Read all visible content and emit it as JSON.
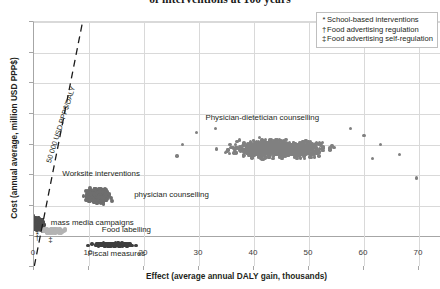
{
  "chart_data": {
    "type": "scatter",
    "title": "of interventions at 100 years",
    "xlabel": "Effect (average annual DALY gain, thousands)",
    "ylabel": "Cost (annual average, million USD PPP$)",
    "xlim": [
      0,
      80
    ],
    "ylim": [
      -100,
      700
    ],
    "xticks": [
      0,
      10,
      20,
      30,
      40,
      50,
      60,
      70,
      80
    ],
    "yticks": [
      -100,
      0,
      100,
      200,
      300,
      400,
      500,
      600,
      700
    ],
    "grid": true,
    "legend_position": "top-right",
    "legend": [
      {
        "marker": "*",
        "label": "School-based interventions"
      },
      {
        "marker": "†",
        "label": "Food advertising regulation"
      },
      {
        "marker": "‡",
        "label": "Food advertising self-regulation"
      }
    ],
    "threshold_line": {
      "label": "50 000 USD PPP$/DALY",
      "x0": 0,
      "y0": -100,
      "x1": 8.8,
      "y1": 700
    },
    "annotations": [
      {
        "text": "Physician-dietetician counselling",
        "x": 41.5,
        "y": 385
      },
      {
        "text": "Worksite interventions",
        "x": 12.2,
        "y": 205
      },
      {
        "text": "physician counselling",
        "x": 25.0,
        "y": 135
      },
      {
        "text": "mass media campaigns",
        "x": 10.6,
        "y": 45
      },
      {
        "text": "Food labelling",
        "x": 16.8,
        "y": 22
      },
      {
        "text": "Fiscal measures",
        "x": 15.0,
        "y": -58
      }
    ],
    "point_markers": [
      {
        "symbol": "*",
        "x": 0.6,
        "y": 8,
        "note": "School-based interventions"
      },
      {
        "symbol": "‡",
        "x": 3.0,
        "y": -8,
        "note": "Food advertising self-regulation"
      },
      {
        "symbol": "†",
        "x": 0.6,
        "y": -2,
        "note": "Food advertising regulation"
      }
    ],
    "series": [
      {
        "name": "Physician-dietetician counselling",
        "color": "#808080",
        "n": 1100,
        "x_center": 44.5,
        "y_center": 287,
        "x_spread": 8.2,
        "y_spread": 27,
        "radius": 1.7
      },
      {
        "name": "physician counselling / Worksite interventions",
        "color": "#6e6e6e",
        "n": 620,
        "x_center": 11.6,
        "y_center": 133,
        "x_spread": 2.0,
        "y_spread": 22,
        "radius": 1.9
      },
      {
        "name": "mass media campaigns",
        "color": "#4d4d4d",
        "n": 210,
        "x_center": 0.9,
        "y_center": 42,
        "x_spread": 0.9,
        "y_spread": 20,
        "radius": 1.8
      },
      {
        "name": "Food labelling",
        "color": "#b3b3b3",
        "n": 190,
        "x_center": 3.6,
        "y_center": 18,
        "x_spread": 1.9,
        "y_spread": 7,
        "radius": 1.8
      },
      {
        "name": "Fiscal measures",
        "color": "#3f3f3f",
        "n": 430,
        "x_center": 14.6,
        "y_center": -27,
        "x_spread": 3.4,
        "y_spread": 5,
        "radius": 1.7
      }
    ],
    "outliers": [
      {
        "x": 69.5,
        "y": 190
      },
      {
        "x": 63.0,
        "y": 300
      },
      {
        "x": 66.5,
        "y": 268
      },
      {
        "x": 61.5,
        "y": 255
      },
      {
        "x": 60.0,
        "y": 330
      },
      {
        "x": 57.5,
        "y": 352
      },
      {
        "x": 33.0,
        "y": 352
      },
      {
        "x": 29.5,
        "y": 340
      },
      {
        "x": 27.0,
        "y": 300
      },
      {
        "x": 26.0,
        "y": 262
      }
    ]
  }
}
